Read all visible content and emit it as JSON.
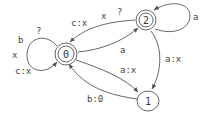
{
  "diagram": {
    "type": "finite-state-transducer",
    "colors": {
      "stroke": "#555555",
      "text": "#444444",
      "background": "#ffffff"
    },
    "states": [
      {
        "id": "0",
        "label": "0",
        "accepting": true
      },
      {
        "id": "1",
        "label": "1",
        "accepting": false
      },
      {
        "id": "2",
        "label": "2",
        "accepting": true
      }
    ],
    "transitions": [
      {
        "from": "0",
        "to": "0",
        "labels": [
          "b",
          "?",
          "x",
          "c:x"
        ]
      },
      {
        "from": "2",
        "to": "2",
        "labels": [
          "a"
        ]
      },
      {
        "from": "2",
        "to": "0",
        "labels": [
          "c:x",
          "x",
          "?"
        ]
      },
      {
        "from": "0",
        "to": "2",
        "labels": [
          "a"
        ]
      },
      {
        "from": "2",
        "to": "1",
        "labels": [
          "a:x"
        ]
      },
      {
        "from": "0",
        "to": "1",
        "labels": [
          "a:x"
        ]
      },
      {
        "from": "1",
        "to": "0",
        "labels": [
          "b:0"
        ]
      }
    ]
  }
}
